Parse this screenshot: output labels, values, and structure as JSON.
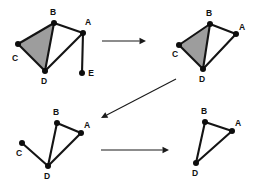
{
  "figure": {
    "background_color": "#ffffff",
    "line_color": "#141414",
    "node_color": "#0d0d0d",
    "face_fill_color": "#9d9d9d",
    "arrow_color": "#1a1a1a",
    "panel_count": 4
  },
  "panels": [
    {
      "id": "panel-1",
      "position": "top-left",
      "nodes": [
        {
          "label": "A",
          "x": 83,
          "y": 33,
          "label_x": 88,
          "label_y": 23
        },
        {
          "label": "B",
          "x": 54,
          "y": 23,
          "label_x": 53,
          "label_y": 13
        },
        {
          "label": "C",
          "x": 18,
          "y": 44,
          "label_x": 15,
          "label_y": 59
        },
        {
          "label": "D",
          "x": 45,
          "y": 71,
          "label_x": 44,
          "label_y": 82
        },
        {
          "label": "E",
          "x": 82,
          "y": 73,
          "label_x": 91,
          "label_y": 74
        }
      ],
      "edges": [
        {
          "from": "B",
          "to": "A"
        },
        {
          "from": "B",
          "to": "C"
        },
        {
          "from": "B",
          "to": "D"
        },
        {
          "from": "C",
          "to": "D"
        },
        {
          "from": "D",
          "to": "A"
        },
        {
          "from": "A",
          "to": "E"
        }
      ],
      "shaded_faces": [
        [
          "B",
          "C",
          "D"
        ]
      ]
    },
    {
      "id": "panel-2",
      "position": "top-right",
      "nodes": [
        {
          "label": "A",
          "x": 236,
          "y": 34,
          "label_x": 242,
          "label_y": 28
        },
        {
          "label": "B",
          "x": 210,
          "y": 24,
          "label_x": 209,
          "label_y": 14
        },
        {
          "label": "C",
          "x": 179,
          "y": 45,
          "label_x": 175,
          "label_y": 55
        },
        {
          "label": "D",
          "x": 203,
          "y": 69,
          "label_x": 202,
          "label_y": 80
        }
      ],
      "edges": [
        {
          "from": "B",
          "to": "A"
        },
        {
          "from": "B",
          "to": "C"
        },
        {
          "from": "B",
          "to": "D"
        },
        {
          "from": "C",
          "to": "D"
        },
        {
          "from": "D",
          "to": "A"
        }
      ],
      "shaded_faces": [
        [
          "B",
          "C",
          "D"
        ]
      ]
    },
    {
      "id": "panel-3",
      "position": "bottom-left",
      "nodes": [
        {
          "label": "A",
          "x": 81,
          "y": 133,
          "label_x": 87,
          "label_y": 126
        },
        {
          "label": "B",
          "x": 57,
          "y": 123,
          "label_x": 56,
          "label_y": 113
        },
        {
          "label": "C",
          "x": 22,
          "y": 143,
          "label_x": 19,
          "label_y": 154
        },
        {
          "label": "D",
          "x": 48,
          "y": 166,
          "label_x": 47,
          "label_y": 177
        }
      ],
      "edges": [
        {
          "from": "B",
          "to": "A"
        },
        {
          "from": "B",
          "to": "D"
        },
        {
          "from": "C",
          "to": "D"
        },
        {
          "from": "D",
          "to": "A"
        }
      ],
      "shaded_faces": []
    },
    {
      "id": "panel-4",
      "position": "bottom-right",
      "nodes": [
        {
          "label": "A",
          "x": 232,
          "y": 131,
          "label_x": 238,
          "label_y": 124
        },
        {
          "label": "B",
          "x": 205,
          "y": 122,
          "label_x": 204,
          "label_y": 112
        },
        {
          "label": "D",
          "x": 196,
          "y": 163,
          "label_x": 195,
          "label_y": 174
        }
      ],
      "edges": [
        {
          "from": "B",
          "to": "A"
        },
        {
          "from": "B",
          "to": "D"
        },
        {
          "from": "D",
          "to": "A"
        }
      ],
      "shaded_faces": []
    }
  ],
  "arrows": [
    {
      "id": "arrow-1",
      "name": "arrow-panel1-to-panel2",
      "from_panel": "panel-1",
      "to_panel": "panel-2",
      "x1": 102,
      "y1": 41,
      "x2": 146,
      "y2": 41
    },
    {
      "id": "arrow-2",
      "name": "arrow-panel2-to-panel3",
      "from_panel": "panel-2",
      "to_panel": "panel-3",
      "x1": 176,
      "y1": 79,
      "x2": 101,
      "y2": 118
    },
    {
      "id": "arrow-3",
      "name": "arrow-panel3-to-panel4",
      "from_panel": "panel-3",
      "to_panel": "panel-4",
      "x1": 101,
      "y1": 150,
      "x2": 169,
      "y2": 150
    }
  ]
}
